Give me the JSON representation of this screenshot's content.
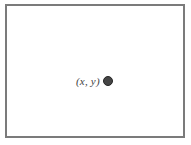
{
  "figure": {
    "point_label": "(x, y)",
    "colors": {
      "background": "#ffffff",
      "plane_fill": "#ffffff",
      "plane_border": "#7b7b7b",
      "label_text": "#424242",
      "dot_fill": "#454545",
      "dot_border": "#262626"
    }
  }
}
